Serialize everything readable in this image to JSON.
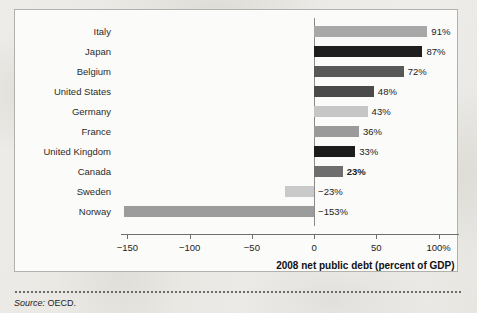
{
  "figure": {
    "source_prefix": "Source:",
    "source_text": "OECD."
  },
  "chart_data": {
    "type": "bar",
    "orientation": "horizontal",
    "title": "",
    "xlabel": "2008 net public debt (percent of GDP)",
    "ylabel": "",
    "xlim": [
      -160,
      110
    ],
    "xticks": [
      -150,
      -100,
      -50,
      0,
      50,
      100
    ],
    "xticklabels": [
      "−150",
      "−100",
      "−50",
      "0",
      "50",
      "100%"
    ],
    "grid": false,
    "legend": null,
    "categories": [
      "Italy",
      "Japan",
      "Belgium",
      "United States",
      "Germany",
      "France",
      "United Kingdom",
      "Canada",
      "Sweden",
      "Norway"
    ],
    "values": [
      91,
      87,
      72,
      48,
      43,
      36,
      33,
      23,
      -23,
      -153
    ],
    "value_labels": [
      "91%",
      "87%",
      "72%",
      "48%",
      "43%",
      "36%",
      "33%",
      "23%",
      "−23%",
      "−153%"
    ],
    "bar_colors": [
      "#a8a8a8",
      "#1e1e1e",
      "#585858",
      "#4a4a4a",
      "#c6c6c6",
      "#9a9a9a",
      "#1c1c1c",
      "#6e6e6e",
      "#c9c9c9",
      "#9c9c9c"
    ],
    "label_bold": [
      false,
      false,
      false,
      false,
      false,
      false,
      false,
      true,
      false,
      false
    ]
  }
}
